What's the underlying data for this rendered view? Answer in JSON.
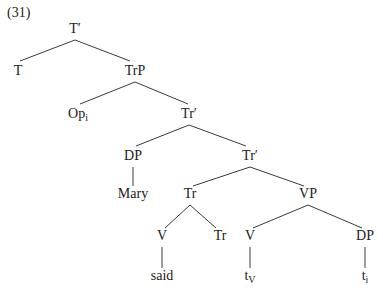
{
  "example_number": "(31)",
  "tree": {
    "nodes": [
      {
        "id": "n1",
        "label": "T′",
        "sub": "",
        "x": 75,
        "y": 21
      },
      {
        "id": "n2",
        "label": "T",
        "sub": "",
        "x": 18,
        "y": 63
      },
      {
        "id": "n3",
        "label": "TrP",
        "sub": "",
        "x": 135,
        "y": 63
      },
      {
        "id": "n4",
        "label": "Op",
        "sub": "i",
        "x": 78,
        "y": 106
      },
      {
        "id": "n5",
        "label": "Tr′",
        "sub": "",
        "x": 189,
        "y": 106
      },
      {
        "id": "n6",
        "label": "DP",
        "sub": "",
        "x": 133,
        "y": 148
      },
      {
        "id": "n7",
        "label": "Tr′",
        "sub": "",
        "x": 250,
        "y": 148
      },
      {
        "id": "n8",
        "label": "Mary",
        "sub": "",
        "x": 133,
        "y": 186
      },
      {
        "id": "n9",
        "label": "Tr",
        "sub": "",
        "x": 190,
        "y": 186
      },
      {
        "id": "n10",
        "label": "VP",
        "sub": "",
        "x": 308,
        "y": 186
      },
      {
        "id": "n11",
        "label": "V",
        "sub": "",
        "x": 162,
        "y": 228
      },
      {
        "id": "n12",
        "label": "Tr",
        "sub": "",
        "x": 220,
        "y": 228
      },
      {
        "id": "n13",
        "label": "V",
        "sub": "",
        "x": 250,
        "y": 228
      },
      {
        "id": "n14",
        "label": "DP",
        "sub": "",
        "x": 365,
        "y": 228
      },
      {
        "id": "n15",
        "label": "said",
        "sub": "",
        "x": 162,
        "y": 268
      },
      {
        "id": "n16",
        "label": "t",
        "sub": "V",
        "x": 250,
        "y": 268
      },
      {
        "id": "n17",
        "label": "t",
        "sub": "i",
        "x": 365,
        "y": 268
      }
    ],
    "edges": [
      [
        "n1",
        "n2"
      ],
      [
        "n1",
        "n3"
      ],
      [
        "n3",
        "n4"
      ],
      [
        "n3",
        "n5"
      ],
      [
        "n5",
        "n6"
      ],
      [
        "n5",
        "n7"
      ],
      [
        "n6",
        "n8"
      ],
      [
        "n7",
        "n9"
      ],
      [
        "n7",
        "n10"
      ],
      [
        "n9",
        "n11"
      ],
      [
        "n9",
        "n12"
      ],
      [
        "n10",
        "n13"
      ],
      [
        "n10",
        "n14"
      ],
      [
        "n11",
        "n15"
      ],
      [
        "n13",
        "n16"
      ],
      [
        "n14",
        "n17"
      ]
    ]
  }
}
